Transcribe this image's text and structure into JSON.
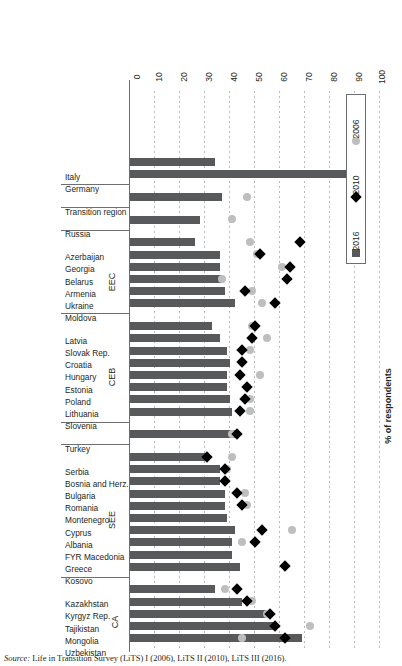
{
  "chart_data": {
    "type": "bar",
    "title": "",
    "xlabel": "",
    "ylabel": "% of respondents",
    "ylim": [
      0,
      100
    ],
    "grid": true,
    "orientation": "horizontal",
    "legend_position": "inside-left",
    "axis_ticks": [
      "0",
      "10",
      "20",
      "30",
      "40",
      "50",
      "60",
      "70",
      "80",
      "90",
      "100"
    ],
    "series": [
      {
        "name": "2016",
        "marker": "square",
        "color": "#58595b"
      },
      {
        "name": "2010",
        "marker": "diamond",
        "color": "#000000"
      },
      {
        "name": "2006",
        "marker": "circle",
        "color": "#bcbec0"
      }
    ],
    "groups": [
      {
        "label": "CA",
        "categories": [
          "Uzbekistan",
          "Mongolia",
          "Tajikistan",
          "Kyrgyz Rep.",
          "Kazakhstan"
        ],
        "v2016": [
          69,
          58,
          56,
          45,
          34
        ],
        "v2010": [
          62,
          58,
          56,
          47,
          43
        ],
        "v2006": [
          45,
          72,
          55,
          49,
          38
        ]
      },
      {
        "label": "SEE",
        "categories": [
          "Kosovo",
          "Greece",
          "FYR Macedonia",
          "Albania",
          "Cyprus",
          "Montenegro",
          "Romania",
          "Bulgaria",
          "Bosnia and Herz.",
          "Serbia"
        ],
        "v2016": [
          44,
          41,
          41,
          42,
          39,
          38,
          38,
          36,
          36,
          30
        ],
        "v2010": [
          62,
          null,
          50,
          53,
          null,
          45,
          43,
          38,
          38,
          31
        ],
        "v2006": [
          null,
          null,
          45,
          65,
          null,
          47,
          46,
          38,
          39,
          41
        ]
      },
      {
        "label": "",
        "categories": [
          "Turkey"
        ],
        "v2016": [
          43
        ],
        "v2010": [
          43
        ],
        "v2006": [
          41
        ]
      },
      {
        "label": "CEB",
        "categories": [
          "Slovenia",
          "Lithuania",
          "Poland",
          "Estonia",
          "Hungary",
          "Croatia",
          "Slovak Rep.",
          "Latvia"
        ],
        "v2016": [
          41,
          40,
          39,
          39,
          40,
          39,
          36,
          33
        ],
        "v2010": [
          44,
          46,
          47,
          44,
          45,
          45,
          49,
          50
        ],
        "v2006": [
          48,
          48,
          47,
          52,
          45,
          48,
          55,
          49
        ]
      },
      {
        "label": "EEC",
        "categories": [
          "Moldova",
          "Ukraine",
          "Armenia",
          "Belarus",
          "Georgia",
          "Azerbaijan"
        ],
        "v2016": [
          42,
          38,
          37,
          36,
          36,
          26
        ],
        "v2010": [
          58,
          46,
          63,
          64,
          52,
          68
        ],
        "v2006": [
          53,
          49,
          37,
          61,
          51,
          48
        ]
      },
      {
        "label": "",
        "categories": [
          "Russia"
        ],
        "v2016": [
          28
        ],
        "v2010": null,
        "v2006": [
          41
        ]
      },
      {
        "label": "",
        "categories": [
          "Transition region"
        ],
        "v2016": [
          37
        ],
        "v2010": null,
        "v2006": [
          47
        ]
      },
      {
        "label": "",
        "categories": [
          "Germany",
          "Italy"
        ],
        "v2016": [
          87,
          34
        ],
        "v2010": null,
        "v2006": null
      }
    ]
  },
  "legend": {
    "items": [
      {
        "label": "2016",
        "marker": "square"
      },
      {
        "label": "2010",
        "marker": "diamond"
      },
      {
        "label": "2006",
        "marker": "circle"
      }
    ]
  },
  "axis": {
    "title": "% of respondents",
    "ticks": [
      "0",
      "10",
      "20",
      "30",
      "40",
      "50",
      "60",
      "70",
      "80",
      "90",
      "100"
    ]
  },
  "source": {
    "prefix": "Source:",
    "text": "Life in Transition Survey (LiTS) I (2006), LiTS II (2010), LiTS III (2016)."
  }
}
